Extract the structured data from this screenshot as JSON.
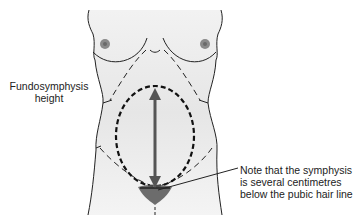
{
  "figure": {
    "labels": {
      "left_line1": "Fundosymphysis",
      "left_line2": "height",
      "note_line1": "Note that the symphysis",
      "note_line2": "is several centimetres",
      "note_line3": "below the pubic hair line"
    },
    "colors": {
      "body_fill": "#e8e8e8",
      "outline": "#222222",
      "arrow": "#555555",
      "nipple": "#8a8a8a"
    }
  }
}
